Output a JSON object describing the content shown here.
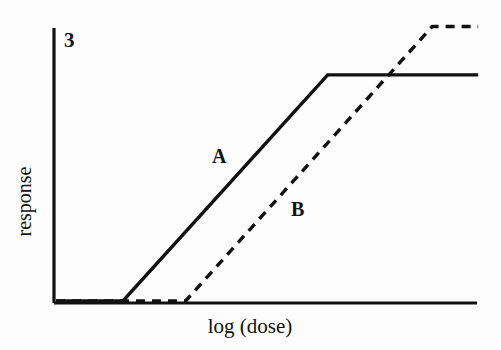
{
  "figure": {
    "number_label": "3",
    "background_color": "#fdfdfd",
    "ink_color": "#111111"
  },
  "chart_data": {
    "type": "line",
    "title": "",
    "subtitle": "",
    "xlabel": "log (dose)",
    "ylabel": "response",
    "grid": false,
    "legend_position": "inline-annotation",
    "axis_style": "left-and-bottom-spines-only",
    "ticks": {
      "x_ticks": [],
      "y_ticks": [],
      "note": "No numeric tick marks or tick labels are drawn on either axis."
    },
    "xlim": [
      0,
      1
    ],
    "ylim": [
      0,
      1
    ],
    "annotations": [
      {
        "text": "3",
        "role": "figure-number",
        "x": 0.02,
        "y": 0.97
      },
      {
        "text": "A",
        "role": "curve-label",
        "x": 0.39,
        "y": 0.545
      },
      {
        "text": "B",
        "role": "curve-label",
        "x": 0.58,
        "y": 0.355
      }
    ],
    "series": [
      {
        "name": "A",
        "label": "A",
        "linestyle": "solid",
        "color": "#111111",
        "linewidth": 3,
        "shape": "piecewise-linear sigmoid: flat baseline, linear rise, plateau",
        "x": [
          0.0,
          0.16,
          0.65,
          1.01
        ],
        "y": [
          0.0,
          0.0,
          0.785,
          0.785
        ],
        "breakpoints": {
          "threshold_x": 0.16,
          "plateau_x": 0.65,
          "plateau_y": 0.785
        }
      },
      {
        "name": "B",
        "label": "B",
        "linestyle": "dashed",
        "color": "#111111",
        "linewidth": 3,
        "dash_pattern": [
          9,
          7
        ],
        "shape": "piecewise-linear sigmoid shifted right with higher maximum",
        "x": [
          0.0,
          0.31,
          0.9,
          1.01
        ],
        "y": [
          0.0,
          0.0,
          0.953,
          0.953
        ],
        "breakpoints": {
          "threshold_x": 0.31,
          "plateau_x": 0.9,
          "plateau_y": 0.953
        }
      }
    ]
  }
}
